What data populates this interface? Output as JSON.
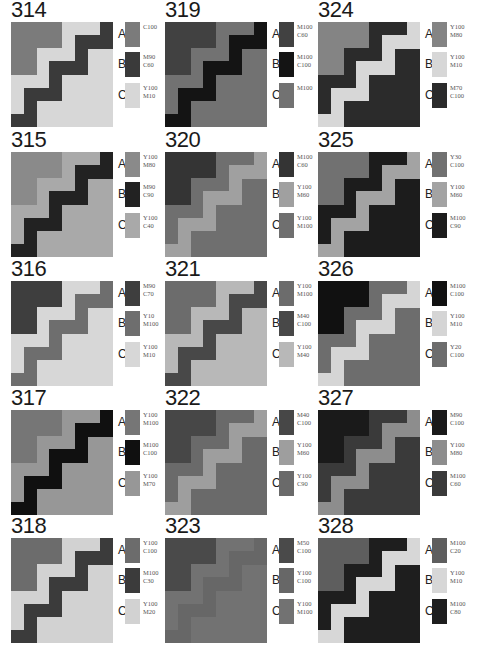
{
  "colors": {
    "C100": "#7a7a7a",
    "M90C60": "#3c3c3c",
    "Y100M10": "#d6d6d6",
    "M100C60": "#3d3d3d",
    "M100C100": "#151515",
    "M100": "#747474",
    "Y100M80": "#858585",
    "M70C100": "#2a2a2a",
    "Y100C40": "#a8a8a8",
    "M100C70_315": "#222222"
  },
  "cards": [
    {
      "number": "314",
      "col": 0,
      "row": 0,
      "swatches": [
        {
          "letter": "A",
          "label": "C100",
          "color": "#7b7b7b"
        },
        {
          "letter": "B",
          "label": "M90\nC60",
          "color": "#3a3a3a"
        },
        {
          "letter": "C",
          "label": "Y100\nM10",
          "color": "#d7d7d7"
        }
      ]
    },
    {
      "number": "315",
      "col": 0,
      "row": 1,
      "swatches": [
        {
          "letter": "A",
          "label": "Y100\nM80",
          "color": "#8a8a8a"
        },
        {
          "letter": "B",
          "label": "M90\nC90",
          "color": "#222222"
        },
        {
          "letter": "C",
          "label": "Y100\nC40",
          "color": "#a9a9a9"
        }
      ]
    },
    {
      "number": "316",
      "col": 0,
      "row": 2,
      "swatches": [
        {
          "letter": "A",
          "label": "M90\nC70",
          "color": "#3e3e3e"
        },
        {
          "letter": "B",
          "label": "Y10\nM100",
          "color": "#6e6e6e"
        },
        {
          "letter": "C",
          "label": "Y100\nM10",
          "color": "#d7d7d7"
        }
      ]
    },
    {
      "number": "317",
      "col": 0,
      "row": 3,
      "swatches": [
        {
          "letter": "A",
          "label": "Y100\nM100",
          "color": "#767676"
        },
        {
          "letter": "B",
          "label": "M100\nC100",
          "color": "#101010"
        },
        {
          "letter": "C",
          "label": "Y100\nM70",
          "color": "#979797"
        }
      ]
    },
    {
      "number": "318",
      "col": 0,
      "row": 4,
      "swatches": [
        {
          "letter": "A",
          "label": "Y100\nC100",
          "color": "#6c6c6c"
        },
        {
          "letter": "B",
          "label": "M100\nC30",
          "color": "#3b3b3b"
        },
        {
          "letter": "C",
          "label": "Y100\nM20",
          "color": "#d2d2d2"
        }
      ]
    },
    {
      "number": "319",
      "col": 1,
      "row": 0,
      "swatches": [
        {
          "letter": "A",
          "label": "M100\nC60",
          "color": "#414141"
        },
        {
          "letter": "B",
          "label": "M100\nC100",
          "color": "#141414"
        },
        {
          "letter": "C",
          "label": "M100",
          "color": "#727272"
        }
      ]
    },
    {
      "number": "320",
      "col": 1,
      "row": 1,
      "swatches": [
        {
          "letter": "A",
          "label": "M100\nC60",
          "color": "#343434"
        },
        {
          "letter": "B",
          "label": "Y100\nM60",
          "color": "#a0a0a0"
        },
        {
          "letter": "C",
          "label": "Y100\nM100",
          "color": "#6f6f6f"
        }
      ]
    },
    {
      "number": "321",
      "col": 1,
      "row": 2,
      "swatches": [
        {
          "letter": "A",
          "label": "Y100\nM100",
          "color": "#6c6c6c"
        },
        {
          "letter": "B",
          "label": "M40\nC100",
          "color": "#484848"
        },
        {
          "letter": "C",
          "label": "Y100\nM40",
          "color": "#b8b8b8"
        }
      ]
    },
    {
      "number": "322",
      "col": 1,
      "row": 3,
      "swatches": [
        {
          "letter": "A",
          "label": "M40\nC100",
          "color": "#474747"
        },
        {
          "letter": "B",
          "label": "Y100\nM60",
          "color": "#9e9e9e"
        },
        {
          "letter": "C",
          "label": "Y100\nC90",
          "color": "#6a6a6a"
        }
      ]
    },
    {
      "number": "323",
      "col": 1,
      "row": 4,
      "swatches": [
        {
          "letter": "A",
          "label": "M50\nC100",
          "color": "#4a4a4a"
        },
        {
          "letter": "B",
          "label": "Y100\nC100",
          "color": "#676767"
        },
        {
          "letter": "C",
          "label": "Y100\nM100",
          "color": "#727272"
        }
      ]
    },
    {
      "number": "324",
      "col": 2,
      "row": 0,
      "swatches": [
        {
          "letter": "A",
          "label": "Y100\nM80",
          "color": "#848484"
        },
        {
          "letter": "B",
          "label": "Y100\nM10",
          "color": "#d7d7d7"
        },
        {
          "letter": "C",
          "label": "M70\nC100",
          "color": "#2b2b2b"
        }
      ]
    },
    {
      "number": "325",
      "col": 2,
      "row": 1,
      "swatches": [
        {
          "letter": "A",
          "label": "Y30\nC100",
          "color": "#717171"
        },
        {
          "letter": "B",
          "label": "Y100\nM60",
          "color": "#a3a3a3"
        },
        {
          "letter": "C",
          "label": "M100\nC90",
          "color": "#1c1c1c"
        }
      ]
    },
    {
      "number": "326",
      "col": 2,
      "row": 2,
      "swatches": [
        {
          "letter": "A",
          "label": "M100\nC100",
          "color": "#111111"
        },
        {
          "letter": "B",
          "label": "Y100\nM10",
          "color": "#d5d5d5"
        },
        {
          "letter": "C",
          "label": "Y20\nC100",
          "color": "#6d6d6d"
        }
      ]
    },
    {
      "number": "327",
      "col": 2,
      "row": 3,
      "swatches": [
        {
          "letter": "A",
          "label": "M90\nC100",
          "color": "#1a1a1a"
        },
        {
          "letter": "B",
          "label": "Y100\nM80",
          "color": "#8d8d8d"
        },
        {
          "letter": "C",
          "label": "M100\nC60",
          "color": "#3a3a3a"
        }
      ]
    },
    {
      "number": "328",
      "col": 2,
      "row": 4,
      "swatches": [
        {
          "letter": "A",
          "label": "M100\nC20",
          "color": "#5e5e5e"
        },
        {
          "letter": "B",
          "label": "Y100\nM10",
          "color": "#d7d7d7"
        },
        {
          "letter": "C",
          "label": "M100\nC80",
          "color": "#1e1e1e"
        }
      ]
    }
  ],
  "layout": {
    "col_x": [
      11,
      165,
      318
    ],
    "row_y": [
      0,
      130,
      259,
      388,
      516
    ]
  }
}
